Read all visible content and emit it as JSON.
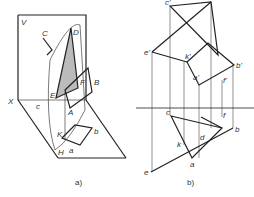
{
  "figure_a": {
    "caption": "a)",
    "labels": {
      "V": "V",
      "X": "X",
      "H": "H",
      "C_upper": "C",
      "D": "D",
      "E": "E",
      "F": "F",
      "B": "B",
      "A": "A",
      "K": "K",
      "c": "c",
      "a": "a",
      "b": "b",
      "l": "l",
      "L": "L"
    }
  },
  "figure_b": {
    "caption": "b)",
    "labels": {
      "c_prime": "c'",
      "e_prime": "e'",
      "d_prime": "d'",
      "k_prime": "k'",
      "l_prime": "l'",
      "b_prime": "b'",
      "a_prime": "a'",
      "f_prime": "f'",
      "c": "c",
      "f": "f",
      "b": "b",
      "d": "d",
      "l": "l",
      "k": "k",
      "a": "a",
      "e": "e"
    }
  }
}
